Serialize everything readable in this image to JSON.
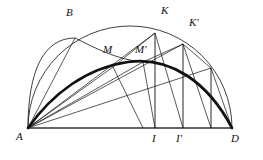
{
  "figure": {
    "type": "geometric-construction-diagram",
    "stroke_color": "#111111",
    "background_color": "#ffffff",
    "thin_stroke_width": 0.7,
    "heavy_stroke_width": 2.6,
    "labels": {
      "A": "A",
      "B": "B",
      "D": "D",
      "M": "M",
      "M_prime": "M'",
      "K": "K",
      "K_prime": "K'",
      "I": "I",
      "I_prime": "I'"
    },
    "points": {
      "A": {
        "x": 28,
        "y": 128
      },
      "D": {
        "x": 232,
        "y": 128
      },
      "B": {
        "x": 75,
        "y": 38
      },
      "M": {
        "x": 113,
        "y": 67
      },
      "Mp": {
        "x": 143,
        "y": 62
      },
      "K": {
        "x": 155,
        "y": 33
      },
      "Kp": {
        "x": 183,
        "y": 44
      },
      "I": {
        "x": 155,
        "y": 128
      },
      "Ip": {
        "x": 183,
        "y": 128
      },
      "T": {
        "x": 211,
        "y": 68
      },
      "center": {
        "x": 130,
        "y": 128
      },
      "radius": 102
    },
    "elements": [
      "baseline-AD",
      "semicircle-AD",
      "arc-A-through-B",
      "heavy-curve-A-to-D",
      "rays-from-A",
      "verticals-K-I",
      "verticals-Kprime-Iprime",
      "chords"
    ]
  }
}
